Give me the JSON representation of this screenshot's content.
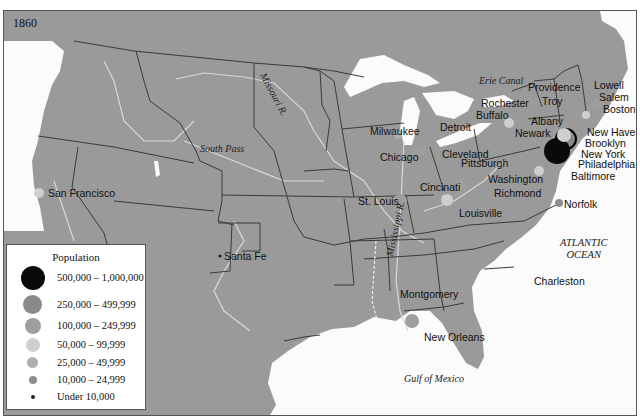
{
  "map": {
    "year": "1860",
    "colors": {
      "land": "#9a9a9a",
      "water": "#fbfbfb",
      "state_border": "#3a3a3a",
      "river": "#d8d8d8"
    },
    "water_labels": {
      "atlantic": [
        "ATLANTIC",
        "OCEAN"
      ],
      "gulf": "Gulf of Mexico"
    },
    "feature_labels": {
      "missouri_river": "Missouri R.",
      "mississippi_river": "Mississippi R.",
      "south_pass": "South Pass",
      "erie_canal": "Erie Canal"
    },
    "cities": [
      {
        "name": "San Francisco",
        "category": "50,000 – 99,999"
      },
      {
        "name": "Santa Fe",
        "category": "Under 10,000"
      },
      {
        "name": "Milwaukee",
        "category": "25,000 – 49,999"
      },
      {
        "name": "Chicago",
        "category": "100,000 – 249,999"
      },
      {
        "name": "St. Louis",
        "category": "100,000 – 249,999"
      },
      {
        "name": "Detroit",
        "category": "25,000 – 49,999"
      },
      {
        "name": "Cleveland",
        "category": "25,000 – 49,999"
      },
      {
        "name": "Cincinati",
        "category": "100,000 – 249,999"
      },
      {
        "name": "Louisville",
        "category": "50,000 – 99,999"
      },
      {
        "name": "Pittsburgh",
        "category": "25,000 – 49,999"
      },
      {
        "name": "Washington",
        "category": "50,000 – 99,999"
      },
      {
        "name": "Richmond",
        "category": "25,000 – 49,999"
      },
      {
        "name": "Norfolk",
        "category": "10,000 – 24,999"
      },
      {
        "name": "Rochester",
        "category": "25,000 – 49,999"
      },
      {
        "name": "Buffalo",
        "category": "50,000 – 99,999"
      },
      {
        "name": "Albany",
        "category": "50,000 – 99,999"
      },
      {
        "name": "Troy",
        "category": "25,000 – 49,999"
      },
      {
        "name": "Providence",
        "category": "50,000 – 99,999"
      },
      {
        "name": "Lowell",
        "category": "25,000 – 49,999"
      },
      {
        "name": "Salem",
        "category": "10,000 – 24,999"
      },
      {
        "name": "Boston",
        "category": "100,000 – 249,999"
      },
      {
        "name": "New Haven",
        "category": "25,000 – 49,999"
      },
      {
        "name": "Newark",
        "category": "50,000 – 99,999"
      },
      {
        "name": "Brooklyn",
        "category": "250,000 – 499,999"
      },
      {
        "name": "New York",
        "category": "500,000 – 1,000,000"
      },
      {
        "name": "Philadelphia",
        "category": "500,000 – 1,000,000"
      },
      {
        "name": "Baltimore",
        "category": "100,000 – 249,999"
      },
      {
        "name": "Charleston",
        "category": "25,000 – 49,999"
      },
      {
        "name": "Montgomery",
        "category": "Under 10,000"
      },
      {
        "name": "New Orleans",
        "category": "100,000 – 249,999"
      }
    ]
  },
  "legend": {
    "title": "Population",
    "items": [
      {
        "label": "500,000 – 1,000,000",
        "color": "#0a0a0a",
        "size": 24
      },
      {
        "label": "250,000 – 499,999",
        "color": "#8a8a8a",
        "size": 19
      },
      {
        "label": "100,000 – 249,999",
        "color": "#9e9e9e",
        "size": 16
      },
      {
        "label": "50,000 – 99,999",
        "color": "#cfcfcf",
        "size": 14
      },
      {
        "label": "25,000 – 49,999",
        "color": "#b0b0b0",
        "size": 11
      },
      {
        "label": "10,000 – 24,999",
        "color": "#8e8e8e",
        "size": 8
      },
      {
        "label": "Under 10,000",
        "color": "#222222",
        "size": 4
      }
    ]
  }
}
